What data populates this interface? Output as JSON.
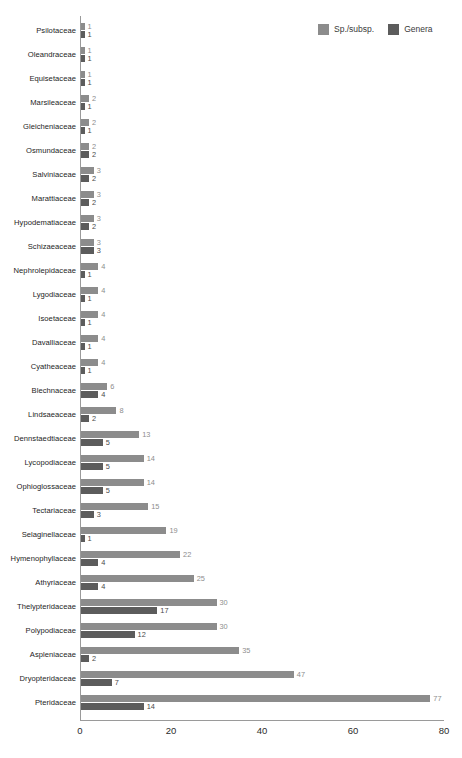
{
  "legend": {
    "position": "top-right",
    "items": [
      {
        "label": "Sp./subsp.",
        "color": "#8c8c8c",
        "icon": "legend-square-icon"
      },
      {
        "label": "Genera",
        "color": "#5c5c5c",
        "icon": "legend-square-icon"
      }
    ]
  },
  "axis": {
    "x_ticks": [
      "0",
      "20",
      "40",
      "60",
      "80"
    ],
    "x_min": 0,
    "x_max": 80
  },
  "chart_data": {
    "type": "bar",
    "orientation": "horizontal",
    "title": "",
    "subtitle": "",
    "xlabel": "",
    "ylabel": "",
    "xlim": [
      0,
      80
    ],
    "xticks": [
      0,
      20,
      40,
      60,
      80
    ],
    "grid": false,
    "legend_position": "top-right",
    "categories": [
      "Psilotaceae",
      "Oleandraceae",
      "Equisetaceae",
      "Marsileaceae",
      "Gleicheniaceae",
      "Osmundaceae",
      "Salviniaceae",
      "Marattiaceae",
      "Hypodematiaceae",
      "Schizaeaceae",
      "Nephrolepidaceae",
      "Lygodiaceae",
      "Isoetaceae",
      "Davalliaceae",
      "Cyatheaceae",
      "Blechnaceae",
      "Lindsaeaceae",
      "Dennstaedtiaceae",
      "Lycopodiaceae",
      "Ophioglossaceae",
      "Tectariaceae",
      "Selaginellaceae",
      "Hymenophyllaceae",
      "Athyriaceae",
      "Thelypteridaceae",
      "Polypodiaceae",
      "Aspleniaceae",
      "Dryopteridaceae",
      "Pteridaceae"
    ],
    "series": [
      {
        "name": "Sp./subsp.",
        "color": "#8c8c8c",
        "values": [
          1,
          1,
          1,
          2,
          2,
          2,
          3,
          3,
          3,
          3,
          4,
          4,
          4,
          4,
          4,
          6,
          8,
          13,
          14,
          14,
          15,
          19,
          22,
          25,
          30,
          30,
          35,
          47,
          77
        ]
      },
      {
        "name": "Genera",
        "color": "#5c5c5c",
        "values": [
          1,
          1,
          1,
          1,
          1,
          2,
          2,
          2,
          2,
          3,
          1,
          1,
          1,
          1,
          1,
          4,
          2,
          5,
          5,
          5,
          3,
          1,
          4,
          4,
          17,
          12,
          2,
          7,
          14
        ]
      }
    ]
  }
}
